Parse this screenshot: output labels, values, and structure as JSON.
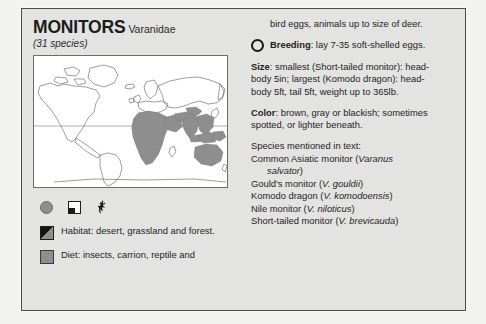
{
  "page": {
    "background_color": "#f2f2f0",
    "panel_color": "#e3e3e1",
    "border_color": "#4a4a4a",
    "range_shade_color": "#8e8e8e"
  },
  "header": {
    "title": "MONITORS",
    "family": "Varanidae",
    "species_count": "(31 species)"
  },
  "map": {
    "label": "world-distribution-map",
    "equator_label": "equator"
  },
  "icons": {
    "circle_label": "breeding-symbol",
    "quadrant_label": "habitat-symbol",
    "animal_label": "monitor-lizard-silhouette"
  },
  "keys": [
    {
      "swatch": "habitat-swatch",
      "label": "Habitat",
      "text": ": desert, grassland and forest."
    },
    {
      "swatch": "diet-swatch",
      "label": "Diet",
      "text": ": insects, carrion, reptile and"
    }
  ],
  "right": {
    "diet_continued": "bird eggs, animals up to size of deer.",
    "breeding_label": "Breeding",
    "breeding_text": ": lay 7-35 soft-shelled eggs.",
    "size_label": "Size",
    "size_text": ": smallest (Short-tailed monitor): head-body 5in; largest (Komodo dragon): head-body 5ft, tail 5ft, weight up to 365lb.",
    "color_label": "Color",
    "color_text": ": brown, gray or blackish; sometimes spotted, or lighter beneath.",
    "species_heading": "Species mentioned in text:",
    "species": [
      {
        "common": "Common Asiatic monitor (",
        "latin": "Varanus",
        "tail": "",
        "indent_latin": "salvator",
        "indent_tail": ")"
      },
      {
        "common": "Gould's monitor (",
        "latin": "V. gouldii",
        "tail": ")"
      },
      {
        "common": "Komodo dragon (",
        "latin": "V. komodoensis",
        "tail": ")"
      },
      {
        "common": "Nile monitor (",
        "latin": "V. niloticus",
        "tail": ")"
      },
      {
        "common": "Short-tailed monitor (",
        "latin": "V. brevicauda",
        "tail": ")"
      }
    ]
  }
}
